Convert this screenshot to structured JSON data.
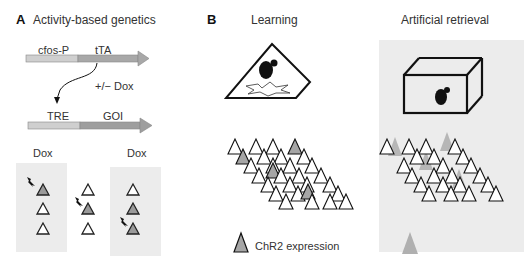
{
  "panel_a": {
    "letter": "A",
    "title": "Activity-based genetics",
    "construct1": {
      "promoter": "cfos-P",
      "gene": "tTA"
    },
    "regulation_label": "+/− Dox",
    "construct2": {
      "promoter": "TRE",
      "gene": "GOI"
    },
    "dox_left": "Dox",
    "dox_right": "Dox"
  },
  "panel_b": {
    "letter": "B",
    "learning_title": "Learning",
    "retrieval_title": "Artificial retrieval",
    "legend_chr2": "ChR2   expression",
    "legend_light": "Light activated"
  },
  "colors": {
    "promoter_fill": "#cfcfcf",
    "gene_fill": "#a8a8a8",
    "panel_bg": "#ececec",
    "chr2_fill": "#a6a6a6",
    "light_fill": "#b0b0b0",
    "outline": "#111111"
  }
}
